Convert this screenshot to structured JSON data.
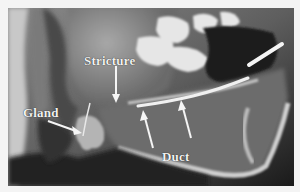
{
  "figure": {
    "labels": {
      "stricture": "Stricture",
      "gland": "Gland",
      "duct": "Duct"
    },
    "colors": {
      "border": "#f4f4f4",
      "label_text": "#f2f2f2",
      "arrow": "#f5f5f5"
    }
  }
}
